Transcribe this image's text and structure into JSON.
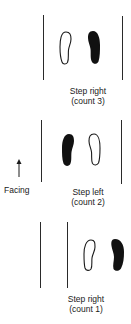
{
  "diagram": {
    "type": "dance-step-footprint-diagram",
    "facing_label": "Facing",
    "colors": {
      "ink": "#1a1a1a",
      "line": "#2a2a2a",
      "background": "#ffffff"
    },
    "steps": [
      {
        "order": 1,
        "position": "top",
        "line1": "Step right",
        "line2": "(count 3)",
        "left_foot": "outline",
        "right_foot": "filled"
      },
      {
        "order": 2,
        "position": "middle",
        "line1": "Step left",
        "line2": "(count 2)",
        "left_foot": "filled",
        "right_foot": "outline"
      },
      {
        "order": 3,
        "position": "bottom",
        "line1": "Step right",
        "line2": "(count 1)",
        "left_foot": "outline",
        "right_foot": "filled"
      }
    ]
  }
}
